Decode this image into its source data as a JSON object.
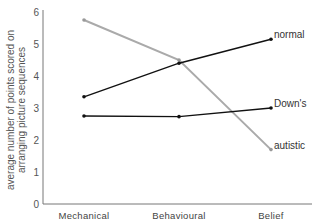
{
  "chart_data": {
    "type": "line",
    "title": "",
    "xlabel": "",
    "ylabel": "average number of points scored on arranging picture sequences",
    "ylabel_lines": [
      "average number of points scored on",
      "arranging picture sequences"
    ],
    "categories": [
      "Mechanical",
      "Behavioural",
      "Belief"
    ],
    "yticks": [
      "0",
      "1",
      "2",
      "3",
      "4",
      "5",
      "6"
    ],
    "ylim": [
      0,
      6
    ],
    "grid": false,
    "legend": "inline labels at right end of lines",
    "series": [
      {
        "name": "normal",
        "values": [
          3.35,
          4.4,
          5.15
        ],
        "color": "#111111"
      },
      {
        "name": "Down's",
        "values": [
          2.75,
          2.73,
          3.0
        ],
        "color": "#111111"
      },
      {
        "name": "autistic",
        "values": [
          5.75,
          4.5,
          1.7
        ],
        "color": "#aaaaaa"
      }
    ]
  }
}
